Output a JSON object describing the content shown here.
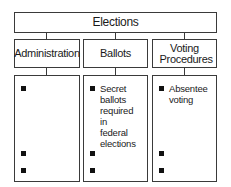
{
  "diagram": {
    "root": {
      "label": "Elections"
    },
    "columns": [
      {
        "label": "Administration",
        "items": [
          {
            "text": ""
          },
          {
            "text": ""
          },
          {
            "text": ""
          }
        ]
      },
      {
        "label": "Ballots",
        "items": [
          {
            "text": "Secret ballots required in federal elections"
          },
          {
            "text": ""
          },
          {
            "text": ""
          }
        ]
      },
      {
        "label": "Voting Procedures",
        "items": [
          {
            "text": "Absentee voting"
          },
          {
            "text": ""
          },
          {
            "text": ""
          }
        ]
      }
    ]
  },
  "colors": {
    "border": "#3a3a3a",
    "bullet": "#111111",
    "background": "#ffffff"
  }
}
